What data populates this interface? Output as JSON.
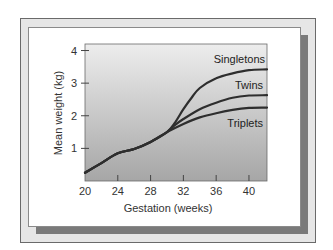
{
  "chart_data": {
    "type": "line",
    "title": "",
    "xlabel": "Gestation (weeks)",
    "ylabel": "Mean weight (kg)",
    "xlim": [
      20,
      42.2
    ],
    "ylim": [
      0,
      4.2
    ],
    "x_ticks": [
      20,
      24,
      28,
      32,
      36,
      40
    ],
    "y_ticks": [
      1,
      2,
      3,
      4
    ],
    "grid": false,
    "legend": "inline labels at right end of curves",
    "background": "vertical gray gradient (light top, darker bottom)",
    "series": [
      {
        "name": "Singletons",
        "x": [
          20,
          22,
          24,
          26,
          28,
          30,
          31,
          32,
          33,
          34,
          36,
          38,
          40,
          42.2
        ],
        "values": [
          0.25,
          0.55,
          0.85,
          0.98,
          1.2,
          1.5,
          1.8,
          2.2,
          2.55,
          2.85,
          3.15,
          3.3,
          3.4,
          3.42
        ]
      },
      {
        "name": "Twins",
        "x": [
          20,
          22,
          24,
          26,
          28,
          30,
          31,
          32,
          34,
          36,
          38,
          40,
          42.2
        ],
        "values": [
          0.25,
          0.55,
          0.85,
          0.98,
          1.2,
          1.5,
          1.72,
          1.9,
          2.2,
          2.4,
          2.55,
          2.62,
          2.63
        ]
      },
      {
        "name": "Triplets",
        "x": [
          20,
          22,
          24,
          26,
          28,
          30,
          32,
          34,
          36,
          38,
          40,
          42.2
        ],
        "values": [
          0.25,
          0.55,
          0.85,
          0.98,
          1.2,
          1.5,
          1.75,
          1.95,
          2.08,
          2.18,
          2.24,
          2.25
        ]
      }
    ]
  },
  "labels": {
    "x_axis": "Gestation (weeks)",
    "y_axis": "Mean weight (kg)",
    "x_ticks": [
      "20",
      "24",
      "28",
      "32",
      "36",
      "40"
    ],
    "y_ticks": [
      "1",
      "2",
      "3",
      "4"
    ],
    "series": [
      "Singletons",
      "Twins",
      "Triplets"
    ]
  },
  "colors": {
    "line": "#2e2e2e",
    "gradient_top": "#ededed",
    "gradient_bottom": "#a6a6a6",
    "frame_shadow": "#7a7a7a"
  }
}
